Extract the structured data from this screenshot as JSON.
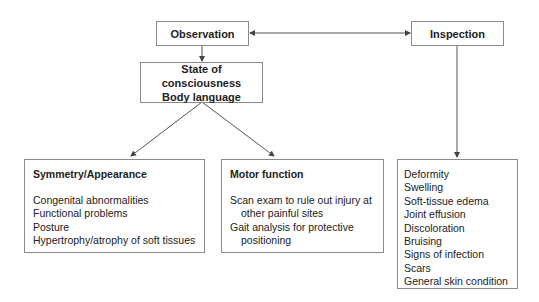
{
  "nodes": {
    "observation": {
      "label": "Observation"
    },
    "inspection": {
      "label": "Inspection"
    },
    "state": {
      "lines": [
        "State of consciousness",
        "Body language"
      ]
    },
    "symmetry": {
      "heading": "Symmetry/Appearance",
      "items": [
        "Congenital abnormalities",
        "Functional problems",
        "Posture",
        "Hypertrophy/atrophy of soft tissues"
      ]
    },
    "motor": {
      "heading": "Motor function",
      "items": [
        "Scan exam to rule out injury at other painful sites",
        "Gait analysis for protective positioning"
      ]
    },
    "inspection_list": {
      "items": [
        {
          "text": "Deformity",
          "level": 0
        },
        {
          "text": "Swelling",
          "level": 0
        },
        {
          "text": "Soft-tissue edema",
          "level": 1
        },
        {
          "text": "Joint effusion",
          "level": 1
        },
        {
          "text": "Discoloration",
          "level": 0
        },
        {
          "text": "Bruising",
          "level": 0
        },
        {
          "text": "Signs of infection",
          "level": 0
        },
        {
          "text": "Scars",
          "level": 0
        },
        {
          "text": "General skin condition",
          "level": 0
        }
      ]
    }
  },
  "edges": [
    {
      "from": "observation",
      "to": "inspection",
      "type": "bidirectional"
    },
    {
      "from": "observation",
      "to": "state",
      "type": "arrow"
    },
    {
      "from": "state",
      "to": "symmetry",
      "type": "arrow"
    },
    {
      "from": "state",
      "to": "motor",
      "type": "arrow"
    },
    {
      "from": "inspection",
      "to": "inspection_list",
      "type": "arrow"
    }
  ],
  "colors": {
    "line": "#555555",
    "border": "#8a8a8a",
    "text": "#222222"
  }
}
